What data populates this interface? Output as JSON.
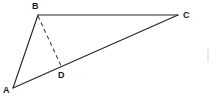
{
  "figure": {
    "type": "geometry-diagram",
    "background_color": "#ffffff",
    "stroke_color": "#262626",
    "dashed_stroke_color": "#3a3a3a",
    "label_color": "#1a1a1a",
    "points": [
      {
        "id": "A",
        "label": "A",
        "x": 13,
        "y": 88,
        "label_x": 3,
        "label_y": 86
      },
      {
        "id": "B",
        "label": "B",
        "x": 38,
        "y": 15,
        "label_x": 32,
        "label_y": 2
      },
      {
        "id": "C",
        "label": "C",
        "x": 178,
        "y": 15,
        "label_x": 183,
        "label_y": 11
      },
      {
        "id": "D",
        "label": "D",
        "x": 62,
        "y": 68,
        "label_x": 58,
        "label_y": 71
      }
    ],
    "segments": [
      {
        "id": "AB",
        "from": "A",
        "to": "B",
        "style": "solid"
      },
      {
        "id": "BC",
        "from": "B",
        "to": "C",
        "style": "solid"
      },
      {
        "id": "AC",
        "from": "A",
        "to": "C",
        "style": "solid"
      },
      {
        "id": "BD",
        "from": "B",
        "to": "D",
        "style": "dashed"
      }
    ],
    "artifact": {
      "id": "right-edge-mark",
      "x": 208,
      "y1": 48,
      "y2": 62,
      "color": "#d8d8d8"
    }
  }
}
